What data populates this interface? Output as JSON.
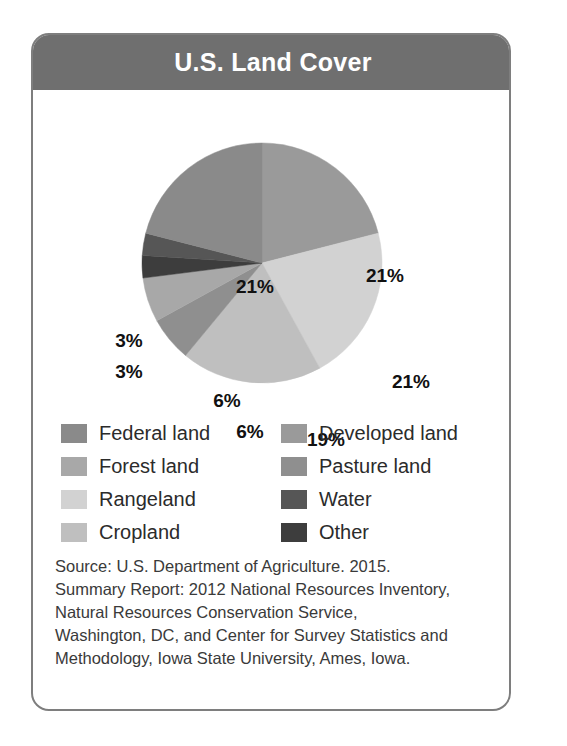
{
  "card": {
    "title": "U.S. Land Cover"
  },
  "chart_data": {
    "type": "pie",
    "title": "U.S. Land Cover",
    "categories": [
      "Developed land",
      "Rangeland",
      "Cropland",
      "Pasture land",
      "Forest land",
      "Other",
      "Water",
      "Federal land"
    ],
    "values": [
      21,
      21,
      19,
      6,
      6,
      3,
      3,
      21
    ],
    "labels": [
      "21%",
      "21%",
      "19%",
      "6%",
      "6%",
      "3%",
      "3%",
      "21%"
    ],
    "colors": [
      "#9a9a9a",
      "#d2d2d2",
      "#bfbfbf",
      "#8f8f8f",
      "#a8a8a8",
      "#3d3d3d",
      "#565656",
      "#8a8a8a"
    ],
    "legend_position": "below",
    "start_angle_deg": 0,
    "direction": "clockwise",
    "xlabel": "",
    "ylabel": ""
  },
  "slice_labels": [
    {
      "text": "21%",
      "x": 352,
      "y": 185
    },
    {
      "text": "21%",
      "x": 378,
      "y": 291
    },
    {
      "text": "19%",
      "x": 293,
      "y": 349
    },
    {
      "text": "6%",
      "x": 217,
      "y": 341
    },
    {
      "text": "6%",
      "x": 194,
      "y": 310
    },
    {
      "text": "3%",
      "x": 96,
      "y": 281
    },
    {
      "text": "3%",
      "x": 96,
      "y": 250
    },
    {
      "text": "21%",
      "x": 222,
      "y": 196
    }
  ],
  "legend": {
    "items": [
      {
        "label": "Federal land",
        "color": "#8a8a8a"
      },
      {
        "label": "Developed land",
        "color": "#9a9a9a"
      },
      {
        "label": "Forest land",
        "color": "#a8a8a8"
      },
      {
        "label": "Pasture land",
        "color": "#8f8f8f"
      },
      {
        "label": "Rangeland",
        "color": "#d2d2d2"
      },
      {
        "label": "Water",
        "color": "#565656"
      },
      {
        "label": "Cropland",
        "color": "#bfbfbf"
      },
      {
        "label": "Other",
        "color": "#3d3d3d"
      }
    ]
  },
  "source": {
    "lines": [
      "Source: U.S. Department of Agriculture. 2015.",
      "Summary Report: 2012 National Resources Inventory,",
      "Natural Resources Conservation Service,",
      "Washington, DC, and Center for Survey Statistics and",
      "Methodology, Iowa State University, Ames, Iowa."
    ]
  },
  "colors": {
    "header_bg": "#6f6f6f",
    "card_border": "#7e7e7e",
    "title_text": "#ffffff"
  }
}
